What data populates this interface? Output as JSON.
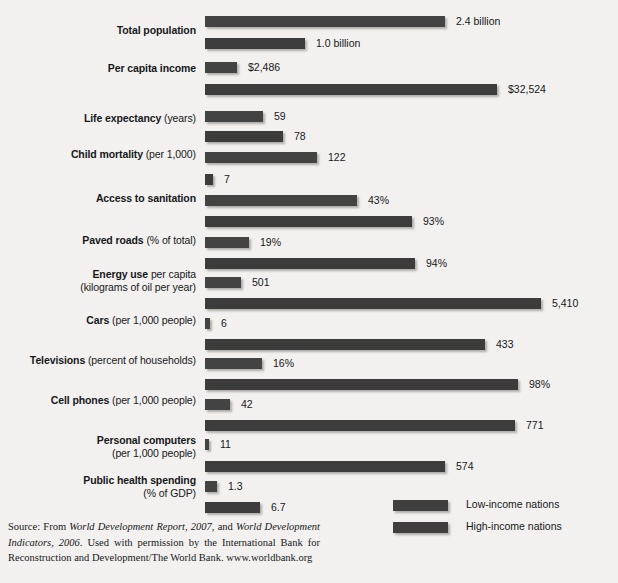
{
  "chart_data": {
    "type": "bar",
    "orientation": "horizontal",
    "title": "",
    "xlabel": "",
    "ylabel": "",
    "grid": false,
    "legend_position": "bottom-right",
    "legend": [
      "Low-income nations",
      "High-income nations"
    ],
    "categories": [
      "Total population",
      "Per capita income",
      "Life expectancy (years)",
      "Child mortality (per 1,000)",
      "Access to sanitation",
      "Paved roads (% of total)",
      "Energy use per capita (kilograms of oil per year)",
      "Cars (per 1,000 people)",
      "Televisions (percent of households)",
      "Cell phones (per 1,000 people)",
      "Personal computers (per 1,000 people)",
      "Public health spending (% of GDP)"
    ],
    "series": [
      {
        "name": "Low-income nations",
        "values": [
          2.4,
          2486,
          59,
          122,
          43,
          19,
          501,
          6,
          16,
          42,
          11,
          1.3
        ],
        "labels": [
          "2.4 billion",
          "$2,486",
          "59",
          "122",
          "43%",
          "19%",
          "501",
          "6",
          "16%",
          "42",
          "11",
          "1.3"
        ]
      },
      {
        "name": "High-income nations",
        "values": [
          1.0,
          32524,
          78,
          7,
          93,
          94,
          5410,
          433,
          98,
          771,
          574,
          6.7
        ],
        "labels": [
          "1.0 billion",
          "$32,524",
          "78",
          "7",
          "93%",
          "94%",
          "5,410",
          "433",
          "98%",
          "771",
          "574",
          "6.7"
        ]
      }
    ],
    "note": "Each indicator pair is drawn to its own independent horizontal scale."
  },
  "rows": [
    {
      "label_bold": "Total population",
      "label_rest": "",
      "label_line2": "",
      "low": {
        "value": "2.4 billion",
        "w": 240
      },
      "high": {
        "value": "1.0 billion",
        "w": 100
      }
    },
    {
      "label_bold": "Per capita income",
      "label_rest": "",
      "label_line2": "",
      "low": {
        "value": "$2,486",
        "w": 32
      },
      "high": {
        "value": "$32,524",
        "w": 292
      }
    },
    {
      "label_bold": "Life expectancy",
      "label_rest": " (years)",
      "label_line2": "",
      "low": {
        "value": "59",
        "w": 58
      },
      "high": {
        "value": "78",
        "w": 78
      }
    },
    {
      "label_bold": "Child mortality",
      "label_rest": " (per 1,000)",
      "label_line2": "",
      "low": {
        "value": "122",
        "w": 112
      },
      "high": {
        "value": "7",
        "w": 8
      }
    },
    {
      "label_bold": "Access to sanitation",
      "label_rest": "",
      "label_line2": "",
      "low": {
        "value": "43%",
        "w": 152
      },
      "high": {
        "value": "93%",
        "w": 207
      }
    },
    {
      "label_bold": "Paved roads",
      "label_rest": " (% of total)",
      "label_line2": "",
      "low": {
        "value": "19%",
        "w": 44
      },
      "high": {
        "value": "94%",
        "w": 210
      }
    },
    {
      "label_bold": "Energy use",
      "label_rest": " per capita",
      "label_line2": "(kilograms of oil per year)",
      "low": {
        "value": "501",
        "w": 36
      },
      "high": {
        "value": "5,410",
        "w": 336
      }
    },
    {
      "label_bold": "Cars",
      "label_rest": " (per 1,000 people)",
      "label_line2": "",
      "low": {
        "value": "6",
        "w": 5
      },
      "high": {
        "value": "433",
        "w": 280
      }
    },
    {
      "label_bold": "Televisions",
      "label_rest": " (percent of households)",
      "label_line2": "",
      "low": {
        "value": "16%",
        "w": 57
      },
      "high": {
        "value": "98%",
        "w": 313
      }
    },
    {
      "label_bold": "Cell phones",
      "label_rest": " (per 1,000 people)",
      "label_line2": "",
      "low": {
        "value": "42",
        "w": 25
      },
      "high": {
        "value": "771",
        "w": 310
      }
    },
    {
      "label_bold": "Personal computers",
      "label_rest": "",
      "label_line2": "(per 1,000 people)",
      "low": {
        "value": "11",
        "w": 4
      },
      "high": {
        "value": "574",
        "w": 240
      }
    },
    {
      "label_bold": "Public health spending",
      "label_rest": "",
      "label_line2": "(% of GDP)",
      "low": {
        "value": "1.3",
        "w": 12
      },
      "high": {
        "value": "6.7",
        "w": 55
      }
    }
  ],
  "legend": {
    "items": [
      {
        "label": "Low-income nations"
      },
      {
        "label": "High-income nations"
      }
    ]
  },
  "source": {
    "prefix": "Source: From ",
    "italic1": "World Development Report, 2007",
    "mid1": ", and ",
    "italic2": "World Development Indicators, 2006",
    "tail": ". Used with permission by the International Bank for Reconstruction and Development/The World Bank. www.worldbank.org"
  },
  "colors": {
    "background": "#f2f1ef",
    "bar": "#3f3f3f",
    "text": "#16181a"
  }
}
